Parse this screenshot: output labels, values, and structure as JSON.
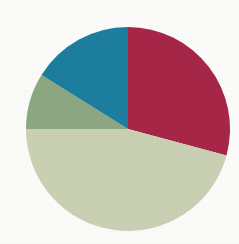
{
  "background_color": "#fdfdfb",
  "chart_data": {
    "type": "pie",
    "title": "",
    "subtitle": "",
    "xlabel": "",
    "ylabel": "",
    "grid": false,
    "legend": "none",
    "center": {
      "cx": 128,
      "cy": 129
    },
    "radius": 102,
    "start_angle_deg": 0,
    "direction": "clockwise",
    "labels": [
      "Crimson segment",
      "Pale green segment",
      "Sage green segment",
      "Teal segment"
    ],
    "values": [
      29,
      46,
      9,
      16
    ],
    "units": "percent",
    "colors": [
      "#a82649",
      "#cbd2b5",
      "#8fa884",
      "#1e7f9e"
    ],
    "slices": [
      {
        "name": "Crimson segment",
        "color": "#a82649",
        "value": 29,
        "percent": "29%",
        "start_angle_deg": 0,
        "end_angle_deg": 105,
        "sweep_deg": 105
      },
      {
        "name": "Pale green segment",
        "color": "#cbd2b5",
        "value": 46,
        "percent": "46%",
        "start_angle_deg": 105,
        "end_angle_deg": 270,
        "sweep_deg": 165
      },
      {
        "name": "Sage green segment",
        "color": "#8fa884",
        "value": 9,
        "percent": "9%",
        "start_angle_deg": 270,
        "end_angle_deg": 302,
        "sweep_deg": 32
      },
      {
        "name": "Teal segment",
        "color": "#1e7f9e",
        "value": 16,
        "percent": "16%",
        "start_angle_deg": 302,
        "end_angle_deg": 360,
        "sweep_deg": 58
      }
    ]
  }
}
